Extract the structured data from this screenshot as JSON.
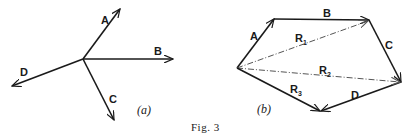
{
  "figure": {
    "caption": "Fig. 3",
    "panels": [
      {
        "id": "a",
        "label": "(a)",
        "vectors": [
          {
            "name": "A",
            "label": "A"
          },
          {
            "name": "B",
            "label": "B"
          },
          {
            "name": "C",
            "label": "C"
          },
          {
            "name": "D",
            "label": "D"
          }
        ]
      },
      {
        "id": "b",
        "label": "(b)",
        "vectors": [
          {
            "name": "A",
            "label": "A"
          },
          {
            "name": "B",
            "label": "B"
          },
          {
            "name": "C",
            "label": "C"
          },
          {
            "name": "D",
            "label": "D"
          }
        ],
        "resultants": [
          {
            "name": "R1",
            "base": "R",
            "sub": "1"
          },
          {
            "name": "R2",
            "base": "R",
            "sub": "2"
          },
          {
            "name": "R3",
            "base": "R",
            "sub": "3"
          }
        ]
      }
    ]
  },
  "colors": {
    "ink": "#1a1a1a",
    "dashed": "#555555",
    "background": "#ffffff"
  }
}
